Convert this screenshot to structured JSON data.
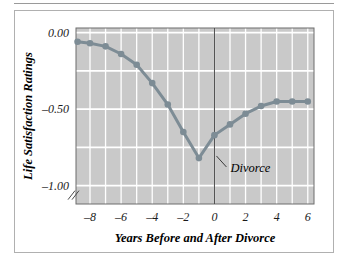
{
  "figure": {
    "frame_border_color": "#b0b0b0",
    "top_rule_color": "#9a9a9a"
  },
  "chart_data": {
    "type": "line",
    "title": "",
    "subtitle": "",
    "xlabel": "Years Before and After Divorce",
    "ylabel": "Life Satisfaction Ratings",
    "x": [
      -8.8,
      -8,
      -7,
      -6,
      -5,
      -4,
      -3,
      -2,
      -1,
      0,
      1,
      2,
      3,
      4,
      5,
      6
    ],
    "values": [
      -0.06,
      -0.07,
      -0.09,
      -0.14,
      -0.21,
      -0.33,
      -0.47,
      -0.65,
      -0.82,
      -0.67,
      -0.6,
      -0.53,
      -0.48,
      -0.45,
      -0.45,
      -0.45
    ],
    "series": [
      {
        "name": "Life satisfaction",
        "values": [
          -0.06,
          -0.07,
          -0.09,
          -0.14,
          -0.21,
          -0.33,
          -0.47,
          -0.65,
          -0.82,
          -0.67,
          -0.6,
          -0.53,
          -0.48,
          -0.45,
          -0.45,
          -0.45
        ]
      }
    ],
    "xlim": [
      -8.9,
      6.4
    ],
    "ylim": [
      -1.12,
      0.03
    ],
    "xticks": [
      -8,
      -6,
      -4,
      -2,
      0,
      2,
      4,
      6
    ],
    "xticklabels": [
      "–8",
      "–6",
      "–4",
      "–2",
      "0",
      "2",
      "4",
      "6"
    ],
    "yticks": [
      0.0,
      -0.5,
      -1.0
    ],
    "yticklabels": [
      "0.00",
      "–0.50",
      "–1.00"
    ],
    "y_minor_step": 0.25,
    "x_minor_step": 1,
    "grid": true,
    "grid_color": "#ffffff",
    "plot_background": "#c9c9c9",
    "line_color": "#7d8c95",
    "marker_color": "#7d8c95",
    "marker_shape": "circle",
    "legend": "none",
    "axis_break": true,
    "annotations": [
      {
        "label": "Divorce",
        "points_to_x": 0,
        "points_to_y": -0.78,
        "style": "italic",
        "marker_line": "vertical-reference-line-at-x-0"
      }
    ]
  }
}
